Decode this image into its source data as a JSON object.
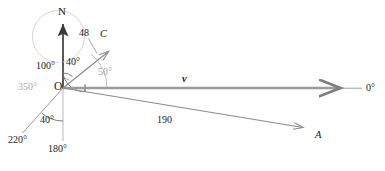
{
  "figure": {
    "type": "vector-bearing-diagram",
    "width": 385,
    "height": 171,
    "background": "#ffffff"
  },
  "colors": {
    "axis_dark": "#3a3a3a",
    "vector_gray": "#8d8d8d",
    "vector_gray_light": "#9a9a9a",
    "arc_gray": "#6f6f6f",
    "arc_gray_light": "#b9b9b9",
    "faint_gray": "#c4c4c4",
    "text_dark": "#1a1a1a",
    "text_gray": "#ababab"
  },
  "geometry": {
    "origin": {
      "x": 63,
      "y": 88,
      "label": "O"
    },
    "axes": [
      {
        "name": "north-axis",
        "angle_deg": 0,
        "bearing_label": "N",
        "tip": {
          "x": 63,
          "y": 20
        }
      },
      {
        "name": "zero-degree-axis",
        "angle_deg": 90,
        "bearing_label": "0°",
        "tip": {
          "x": 362,
          "y": 88
        }
      },
      {
        "name": "one-eighty-axis",
        "angle_deg": 180,
        "bearing_label": "180°",
        "tip": {
          "x": 63,
          "y": 140
        }
      }
    ]
  },
  "vectors": [
    {
      "name": "vector-v",
      "label": "v",
      "bearing_deg": 90,
      "magnitude_label": null,
      "tip": {
        "x": 347,
        "y": 88
      },
      "style": "bold-italic"
    },
    {
      "name": "vector-A",
      "label": "A",
      "bearing_deg": 100,
      "magnitude_label": "190",
      "tip": {
        "x": 310,
        "y": 129
      },
      "style": "italic"
    },
    {
      "name": "vector-C",
      "label": "C",
      "bearing_deg": 40,
      "magnitude_label": "48",
      "tip": {
        "x": 112,
        "y": 48
      },
      "style": "italic"
    },
    {
      "name": "bearing-ray-220",
      "label": null,
      "bearing_deg": 220,
      "magnitude_label": null,
      "tip": {
        "x": 22,
        "y": 133
      },
      "style": "plain"
    }
  ],
  "labels": {
    "north": "N",
    "origin": "O",
    "zero_degrees": "0°",
    "one_eighty_degrees": "180°",
    "three_fifty_degrees": "350°",
    "two_twenty_degrees": "220°",
    "angle_100": "100°",
    "angle_40_upper": "40°",
    "angle_40_lower": "40°",
    "angle_50": "50°",
    "magnitude_48": "48",
    "magnitude_190": "190",
    "vector_v": "v",
    "vector_a": "A",
    "vector_c": "C"
  },
  "angle_arcs": [
    {
      "name": "arc-100-degrees",
      "value_label": "100°",
      "from_deg": 0,
      "to_deg": 100,
      "radius": 22,
      "color": "#6f6f6f"
    },
    {
      "name": "arc-40-degrees-upper",
      "value_label": "40°",
      "from_deg": 0,
      "to_deg": 40,
      "radius": 15,
      "color": "#6f6f6f"
    },
    {
      "name": "arc-50-degrees",
      "value_label": "50°",
      "from_deg": 40,
      "to_deg": 90,
      "radius": 44,
      "color": "#b9b9b9"
    },
    {
      "name": "arc-40-degrees-lower",
      "value_label": "40°",
      "from_deg": 180,
      "to_deg": 220,
      "radius": 33,
      "color": "#6f6f6f"
    },
    {
      "name": "arc-350-degrees",
      "value_label": "350°",
      "from_deg": 0,
      "to_deg": 350,
      "radius": 26,
      "color": "#c4c4c4"
    },
    {
      "name": "arc-bearing-A",
      "value_label": null,
      "from_deg": 90,
      "to_deg": 100,
      "radius": 22,
      "color": "#b9b9b9"
    }
  ]
}
